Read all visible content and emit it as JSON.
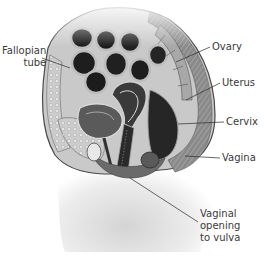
{
  "figure": {
    "colors": {
      "background": "#ffffff",
      "label_text": "#3a3a3a",
      "leader_line": "#2a2a2a",
      "dark_tissue": "#1c1c1c",
      "mid_tissue": "#7a7a7a",
      "light_tissue": "#cfcfcf",
      "skin": "#e6e6e6"
    }
  },
  "labels": [
    {
      "id": "fallopian-tube",
      "lines": [
        "Fallopian",
        "tube"
      ]
    },
    {
      "id": "ovary",
      "lines": [
        "Ovary"
      ]
    },
    {
      "id": "uterus",
      "lines": [
        "Uterus"
      ]
    },
    {
      "id": "cervix",
      "lines": [
        "Cervix"
      ]
    },
    {
      "id": "vagina",
      "lines": [
        "Vagina"
      ]
    },
    {
      "id": "vaginal-opening",
      "lines": [
        "Vaginal",
        "opening",
        "to vulva"
      ]
    }
  ]
}
